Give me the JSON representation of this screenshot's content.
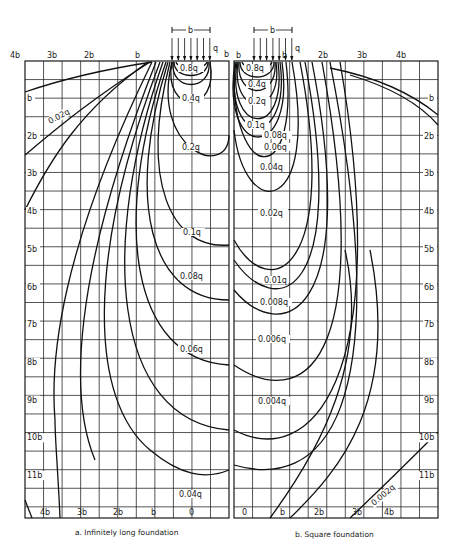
{
  "panels": [
    {
      "id": "a",
      "caption": "a. Infinitely long foundation",
      "top_axis": [
        "4b",
        "3b",
        "2b",
        "b"
      ],
      "bottom_axis": [
        "4b",
        "3b",
        "2b",
        "b",
        "0"
      ],
      "depth_axis": [
        "b",
        "2b",
        "3b",
        "4b",
        "5b",
        "6b",
        "7b",
        "8b",
        "9b",
        "10b",
        "11b"
      ],
      "load": {
        "width_label": "b",
        "pressure_label": "q",
        "edge_label": "b"
      },
      "isobars": [
        "0.8q",
        "0.4q",
        "0.2q",
        "0.1q",
        "0.08q",
        "0.06q",
        "0.04q",
        "0.02q"
      ]
    },
    {
      "id": "b",
      "caption": "b. Square foundation",
      "top_axis": [
        "b",
        "b",
        "2b",
        "3b",
        "4b"
      ],
      "bottom_axis": [
        "0",
        "b",
        "2b",
        "3b",
        "4b"
      ],
      "depth_axis": [
        "b",
        "2b",
        "3b",
        "4b",
        "5b",
        "6b",
        "7b",
        "8b",
        "9b",
        "10b",
        "11b"
      ],
      "load": {
        "width_label": "b",
        "pressure_label": "q"
      },
      "isobars": [
        "0.8q",
        "0.4q",
        "0.2q",
        "0.1q",
        "0.08q",
        "0.06q",
        "0.04q",
        "0.02q",
        "0.01q",
        "0.008q",
        "0.006q",
        "0.004q",
        "0.002q"
      ]
    }
  ]
}
